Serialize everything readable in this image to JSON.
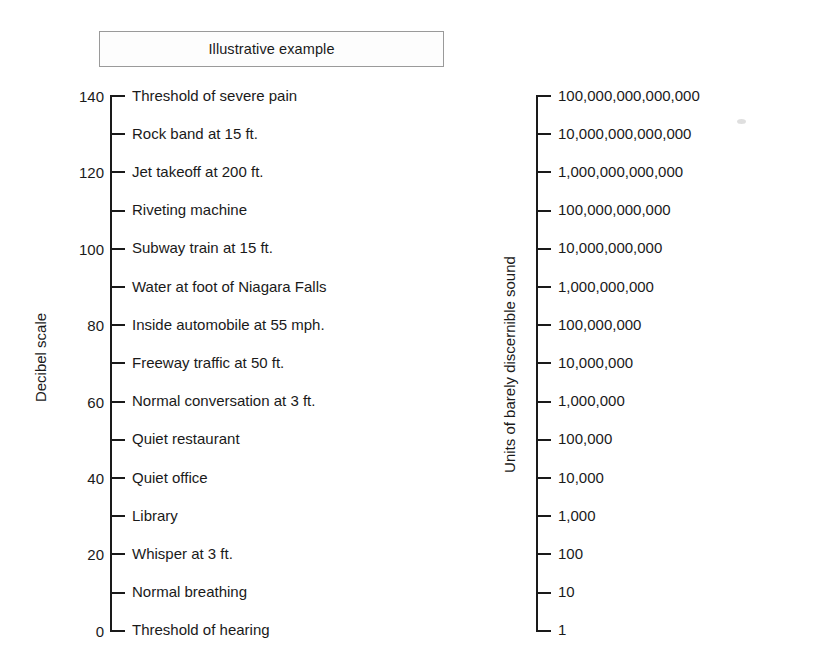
{
  "title": {
    "text": "Illustrative example"
  },
  "left_scale": {
    "axis_title": "Decibel scale",
    "unit": "dB"
  },
  "right_scale": {
    "axis_title": "Units of barely discernible sound"
  },
  "chart_data": {
    "type": "table",
    "title": "Illustrative example",
    "xlabel": "",
    "ylabel": "Decibel scale",
    "ylim": [
      0,
      140
    ],
    "grid": false,
    "legend": null,
    "axes": [
      {
        "name": "left",
        "label": "Decibel scale",
        "range": [
          0,
          140
        ],
        "tick_step": 10,
        "labeled_tick_step": 20
      },
      {
        "name": "right",
        "label": "Units of barely discernible sound",
        "scale": "log10",
        "range": [
          1,
          100000000000000
        ]
      }
    ],
    "rows": [
      {
        "decibels": 140,
        "decibel_label": "140",
        "source": "Threshold of severe pain",
        "units": "100,000,000,000,000",
        "units_value": 100000000000000.0
      },
      {
        "decibels": 130,
        "decibel_label": "",
        "source": "Rock band at 15 ft.",
        "units": "10,000,000,000,000",
        "units_value": 10000000000000.0
      },
      {
        "decibels": 120,
        "decibel_label": "120",
        "source": "Jet takeoff at 200 ft.",
        "units": "1,000,000,000,000",
        "units_value": 1000000000000.0
      },
      {
        "decibels": 110,
        "decibel_label": "",
        "source": "Riveting machine",
        "units": "100,000,000,000",
        "units_value": 100000000000.0
      },
      {
        "decibels": 100,
        "decibel_label": "100",
        "source": "Subway train at 15 ft.",
        "units": "10,000,000,000",
        "units_value": 10000000000.0
      },
      {
        "decibels": 90,
        "decibel_label": "",
        "source": "Water at foot of Niagara Falls",
        "units": "1,000,000,000",
        "units_value": 1000000000.0
      },
      {
        "decibels": 80,
        "decibel_label": "80",
        "source": "Inside automobile at 55 mph.",
        "units": "100,000,000",
        "units_value": 100000000.0
      },
      {
        "decibels": 70,
        "decibel_label": "",
        "source": "Freeway traffic at 50 ft.",
        "units": "10,000,000",
        "units_value": 10000000.0
      },
      {
        "decibels": 60,
        "decibel_label": "60",
        "source": "Normal conversation at 3 ft.",
        "units": "1,000,000",
        "units_value": 1000000.0
      },
      {
        "decibels": 50,
        "decibel_label": "",
        "source": "Quiet restaurant",
        "units": "100,000",
        "units_value": 100000.0
      },
      {
        "decibels": 40,
        "decibel_label": "40",
        "source": "Quiet office",
        "units": "10,000",
        "units_value": 10000.0
      },
      {
        "decibels": 30,
        "decibel_label": "",
        "source": "Library",
        "units": "1,000",
        "units_value": 1000
      },
      {
        "decibels": 20,
        "decibel_label": "20",
        "source": "Whisper at 3 ft.",
        "units": "100",
        "units_value": 100
      },
      {
        "decibels": 10,
        "decibel_label": "",
        "source": "Normal breathing",
        "units": "10",
        "units_value": 10
      },
      {
        "decibels": 0,
        "decibel_label": "0",
        "source": "Threshold of hearing",
        "units": "1",
        "units_value": 1
      }
    ]
  },
  "layout": {
    "first_tick_y": 96,
    "tick_spacing": 38.2
  },
  "colors": {
    "ink": "#1a1a1a",
    "box_border": "#9a9a9a",
    "background": "#ffffff"
  }
}
